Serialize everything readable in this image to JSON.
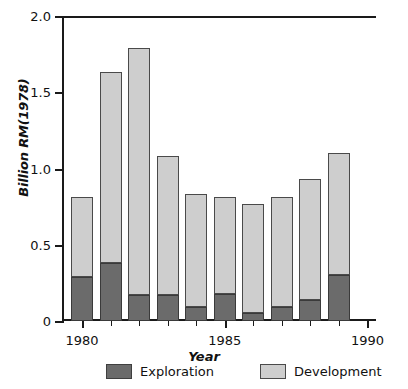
{
  "chart_data": {
    "type": "bar",
    "stacked": true,
    "title": "",
    "xlabel": "Year",
    "ylabel": "Billion RM(1978)",
    "x": [
      1980,
      1981,
      1982,
      1983,
      1984,
      1985,
      1986,
      1987,
      1988,
      1989
    ],
    "categories": [
      "1980",
      "1981",
      "1982",
      "1983",
      "1984",
      "1985",
      "1986",
      "1987",
      "1988",
      "1989"
    ],
    "series": [
      {
        "name": "Exploration",
        "color": "#6b6b6b",
        "values": [
          0.29,
          0.38,
          0.17,
          0.17,
          0.09,
          0.18,
          0.05,
          0.09,
          0.14,
          0.3
        ]
      },
      {
        "name": "Development",
        "color": "#cecece",
        "values": [
          0.52,
          1.25,
          1.62,
          0.91,
          0.74,
          0.63,
          0.72,
          0.72,
          0.79,
          0.8
        ]
      }
    ],
    "totals": [
      0.81,
      1.63,
      1.79,
      1.08,
      0.83,
      0.81,
      0.77,
      0.81,
      0.93,
      1.1
    ],
    "xlim": [
      1979.3,
      1990.3
    ],
    "ylim": [
      0,
      2.0
    ],
    "ytick_values": [
      0,
      0.5,
      1.0,
      1.5,
      2.0
    ],
    "ytick_labels": [
      "0",
      "0.5",
      "1.0",
      "1.5",
      "2.0"
    ],
    "xtick_values": [
      1980,
      1985,
      1990
    ],
    "xtick_labels": [
      "1980",
      "1985",
      "1990"
    ],
    "xtick_minor": [
      1981,
      1982,
      1983,
      1984,
      1986,
      1987,
      1988,
      1989
    ],
    "grid": false,
    "legend_position": "below"
  },
  "legend": {
    "items": [
      {
        "label": "Exploration",
        "color": "#6b6b6b"
      },
      {
        "label": "Development",
        "color": "#cecece"
      }
    ]
  }
}
